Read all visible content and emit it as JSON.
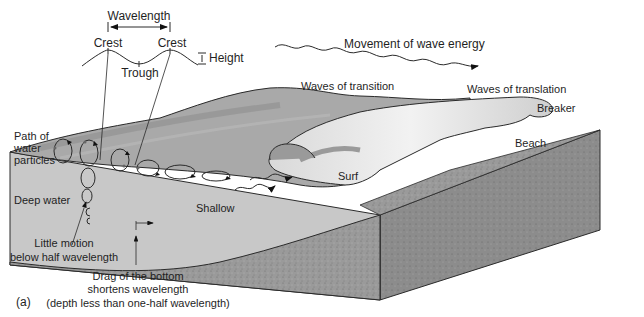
{
  "figure": {
    "panel_label": "(a)",
    "colors": {
      "background": "#ffffff",
      "water_surface": "#a9a9a9",
      "water_surface_dark": "#8f8f8f",
      "water_cross_section": "#c8c8c8",
      "breaking_wave_light": "#e6e6e6",
      "sediment": "#9a9a9a",
      "sediment_front": "#8c8c8c",
      "line": "#2a2a2a"
    }
  },
  "wave_profile": {
    "wavelength_label": "Wavelength",
    "crest_left_label": "Crest",
    "crest_right_label": "Crest",
    "trough_label": "Trough",
    "height_label": "Height"
  },
  "energy": {
    "label": "Movement of wave energy"
  },
  "zones": {
    "waves_of_transition": "Waves of transition",
    "waves_of_translation": "Waves of translation",
    "breaker": "Breaker",
    "beach": "Beach",
    "surf": "Surf",
    "deep_water": "Deep water",
    "shallow": "Shallow"
  },
  "annotations": {
    "particle_path_line1": "Path of",
    "particle_path_line2": "water",
    "particle_path_line3": "particles",
    "little_motion_line1": "Little motion",
    "little_motion_line2": "below half wavelength",
    "drag_line1": "Drag of the bottom",
    "drag_line2": "shortens wavelength",
    "drag_line3": "(depth less than one-half wavelength)"
  }
}
